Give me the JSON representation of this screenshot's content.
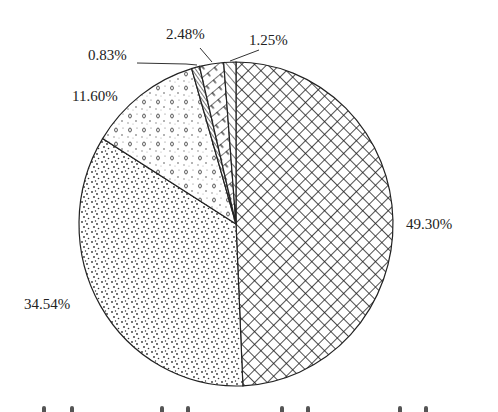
{
  "chart_data": {
    "type": "pie",
    "title": "",
    "start_angle_deg": 0,
    "direction": "clockwise-from-top",
    "slices": [
      {
        "label": "49.30%",
        "value": 49.3,
        "pattern": "crosshatch"
      },
      {
        "label": "34.54%",
        "value": 34.54,
        "pattern": "fine-dots"
      },
      {
        "label": "11.60%",
        "value": 11.6,
        "pattern": "circles-dots"
      },
      {
        "label": "0.83%",
        "value": 0.83,
        "pattern": "dense-diagonal"
      },
      {
        "label": "2.48%",
        "value": 2.48,
        "pattern": "brick-diagonal"
      },
      {
        "label": "1.25%",
        "value": 1.25,
        "pattern": "diagonal"
      }
    ],
    "legend": "clipped (not legible)"
  },
  "labels": {
    "l0": "49.30%",
    "l1": "34.54%",
    "l2": "11.60%",
    "l3": "0.83%",
    "l4": "2.48%",
    "l5": "1.25%"
  }
}
